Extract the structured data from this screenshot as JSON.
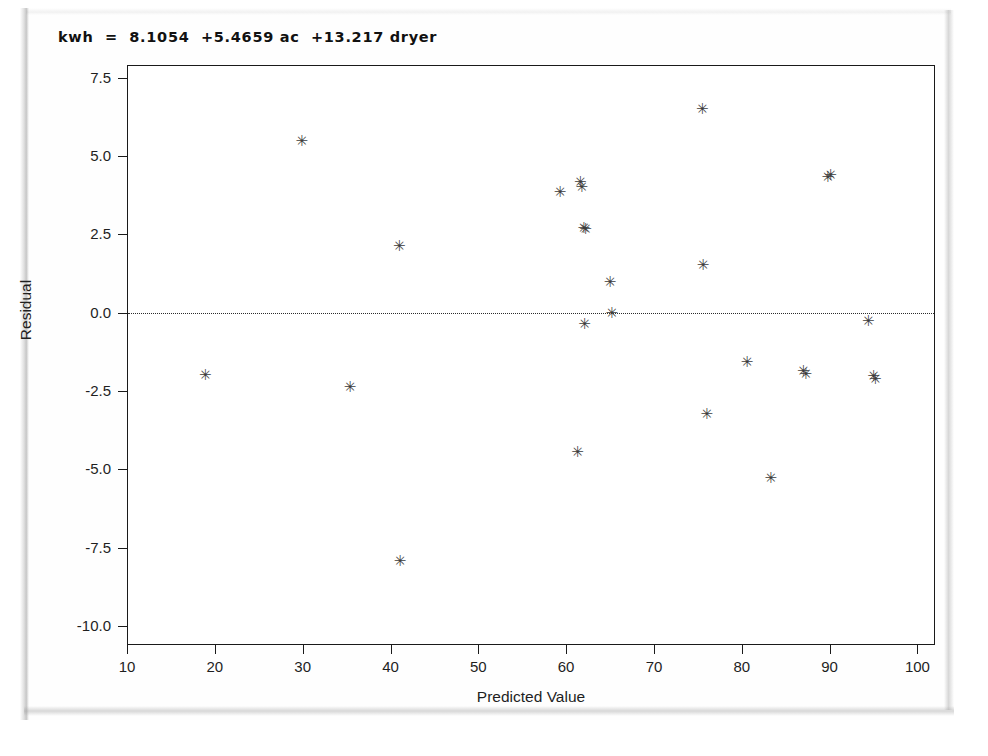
{
  "page": {
    "background_color": "#ffffff",
    "paper_color": "#fefefe"
  },
  "chart_data": {
    "type": "scatter",
    "title": "kwh  =  8.1054  +5.4659 ac  +13.217 dryer",
    "xlabel": "Predicted Value",
    "ylabel": "Residual",
    "xlim": [
      10,
      102
    ],
    "ylim": [
      -10.6,
      7.9
    ],
    "xticks": [
      10,
      20,
      30,
      40,
      50,
      60,
      70,
      80,
      90,
      100
    ],
    "xtick_labels": [
      "10",
      "20",
      "30",
      "40",
      "50",
      "60",
      "70",
      "80",
      "90",
      "100"
    ],
    "yticks": [
      7.5,
      5.0,
      2.5,
      0.0,
      -2.5,
      -5.0,
      -7.5,
      -10.0
    ],
    "ytick_labels": [
      "7.5",
      "5.0",
      "2.5",
      "0.0",
      "-2.5",
      "-5.0",
      "-7.5",
      "-10.0"
    ],
    "grid": false,
    "legend": "none",
    "marker": "asterisk",
    "marker_color": "#3c3c3c",
    "reference_line": {
      "axis": "y",
      "value": 0.0,
      "style": "dotted",
      "color": "#2b2b2b"
    },
    "points": [
      {
        "x": 18.9,
        "y": -2.05
      },
      {
        "x": 29.9,
        "y": 5.42
      },
      {
        "x": 35.4,
        "y": -2.42
      },
      {
        "x": 41.0,
        "y": 2.08
      },
      {
        "x": 41.1,
        "y": -7.98
      },
      {
        "x": 59.3,
        "y": 3.78
      },
      {
        "x": 61.6,
        "y": 4.12
      },
      {
        "x": 61.8,
        "y": 3.95
      },
      {
        "x": 62.0,
        "y": 2.65
      },
      {
        "x": 61.3,
        "y": -4.52
      },
      {
        "x": 62.1,
        "y": -0.42
      },
      {
        "x": 65.0,
        "y": 0.92
      },
      {
        "x": 65.2,
        "y": -0.08
      },
      {
        "x": 75.5,
        "y": 6.42
      },
      {
        "x": 75.6,
        "y": 1.45
      },
      {
        "x": 76.0,
        "y": -3.28
      },
      {
        "x": 80.6,
        "y": -1.62
      },
      {
        "x": 83.3,
        "y": -5.32
      },
      {
        "x": 87.0,
        "y": -1.92
      },
      {
        "x": 87.3,
        "y": -2.02
      },
      {
        "x": 89.8,
        "y": 4.28
      },
      {
        "x": 90.1,
        "y": 4.32
      },
      {
        "x": 94.4,
        "y": -0.32
      },
      {
        "x": 95.0,
        "y": -2.08
      },
      {
        "x": 95.2,
        "y": -2.18
      },
      {
        "x": 62.2,
        "y": 2.62
      }
    ]
  }
}
